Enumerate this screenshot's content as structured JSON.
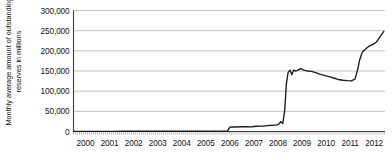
{
  "chart_data": {
    "type": "line",
    "title": "",
    "xlabel": "",
    "ylabel": "Monthly average amount of outstanding reserves in millions",
    "ylim": [
      0,
      300000
    ],
    "xlim": [
      2000,
      2012.95
    ],
    "grid": true,
    "legend": "none",
    "ytick_labels": [
      "300,000",
      "250,000",
      "200,000",
      "150,000",
      "100,000",
      "50,000",
      "0"
    ],
    "ytick_values": [
      300000,
      250000,
      200000,
      150000,
      100000,
      50000,
      0
    ],
    "xtick_labels": [
      "2000",
      "2001",
      "2002",
      "2003",
      "2004",
      "2005",
      "2006",
      "2007",
      "2008",
      "2009",
      "2010",
      "2011",
      "2012"
    ],
    "xtick_values": [
      2000,
      2001,
      2002,
      2003,
      2004,
      2005,
      2006,
      2007,
      2008,
      2009,
      2010,
      2011,
      2012
    ],
    "series": [
      {
        "name": "Outstanding reserves",
        "color": "#1a1a1a",
        "x": [
          2000.0,
          2000.25,
          2000.5,
          2000.75,
          2001.0,
          2001.25,
          2001.5,
          2001.75,
          2002.0,
          2002.25,
          2002.5,
          2002.75,
          2003.0,
          2003.25,
          2003.5,
          2003.75,
          2004.0,
          2004.25,
          2004.5,
          2004.75,
          2005.0,
          2005.25,
          2005.5,
          2005.75,
          2006.0,
          2006.25,
          2006.4,
          2006.5,
          2006.6,
          2006.75,
          2007.0,
          2007.2,
          2007.4,
          2007.5,
          2007.6,
          2007.75,
          2007.9,
          2008.0,
          2008.15,
          2008.3,
          2008.45,
          2008.55,
          2008.62,
          2008.7,
          2008.78,
          2008.85,
          2008.92,
          2009.0,
          2009.08,
          2009.15,
          2009.25,
          2009.35,
          2009.45,
          2009.55,
          2009.65,
          2009.75,
          2009.9,
          2010.0,
          2010.15,
          2010.3,
          2010.5,
          2010.7,
          2010.85,
          2011.0,
          2011.2,
          2011.4,
          2011.55,
          2011.7,
          2011.8,
          2011.9,
          2012.0,
          2012.15,
          2012.3,
          2012.45,
          2012.6,
          2012.75,
          2012.9
        ],
        "y": [
          400,
          420,
          430,
          450,
          460,
          470,
          480,
          500,
          520,
          530,
          540,
          560,
          580,
          600,
          610,
          620,
          640,
          660,
          680,
          700,
          720,
          740,
          760,
          780,
          800,
          820,
          850,
          11000,
          11500,
          11200,
          11800,
          12000,
          11500,
          12500,
          13000,
          13500,
          13200,
          14000,
          15000,
          15500,
          16500,
          19000,
          24500,
          19500,
          52000,
          118000,
          146000,
          152000,
          141000,
          152000,
          150000,
          153000,
          156000,
          153000,
          151000,
          150000,
          149000,
          147000,
          144000,
          141000,
          138000,
          135000,
          132000,
          129000,
          127000,
          126000,
          125500,
          130000,
          150000,
          178000,
          196000,
          205000,
          212000,
          216000,
          222000,
          236000,
          248000
        ]
      }
    ]
  },
  "axes": {
    "y_axis_title": "Monthly average amount of outstanding reserves in millions"
  }
}
